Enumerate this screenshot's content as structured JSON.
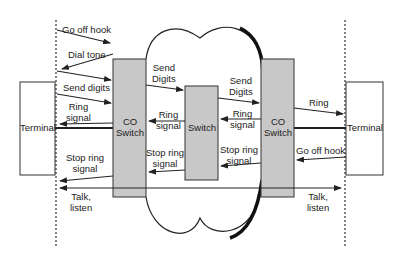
{
  "diagram": {
    "type": "call-setup-sequence",
    "colors": {
      "switch_fill": "#c8c8c8",
      "stroke": "#222222",
      "terminal_fill": "#ffffff",
      "background": "#ffffff"
    },
    "nodes": {
      "left_terminal": "Terminal",
      "left_co_switch": "CO\nSwitch",
      "center_switch": "Switch",
      "right_co_switch": "CO\nSwitch",
      "right_terminal": "Terminal"
    },
    "labels": {
      "go_off_hook_left": "Go off hook",
      "dial_tone": "Dial tone",
      "send_digits_left": "Send digits",
      "ring_signal_left": "Ring\nsignal",
      "stop_ring_signal_left": "Stop ring\nsignal",
      "talk_listen_left": "Talk,\nlisten",
      "send_digits_mid_left": "Send\nDigits",
      "ring_signal_mid_left": "Ring\nsignal",
      "stop_ring_signal_mid_left": "Stop ring\nsignal",
      "send_digits_mid_right": "Send\nDigits",
      "ring_signal_mid_right": "Ring\nsignal",
      "stop_ring_signal_mid_right": "Stop ring\nsignal",
      "ring_right": "Ring",
      "go_off_hook_right": "Go off hook",
      "talk_listen_right": "Talk,\nlisten"
    },
    "messages": [
      {
        "from": "left_terminal",
        "to": "left_co_switch",
        "label": "Go off hook"
      },
      {
        "from": "left_co_switch",
        "to": "left_terminal",
        "label": "Dial tone"
      },
      {
        "from": "left_terminal",
        "to": "left_co_switch",
        "label": "Send digits"
      },
      {
        "from": "left_co_switch",
        "to": "center_switch",
        "label": "Send Digits"
      },
      {
        "from": "center_switch",
        "to": "right_co_switch",
        "label": "Send Digits"
      },
      {
        "from": "right_co_switch",
        "to": "right_terminal",
        "label": "Ring"
      },
      {
        "from": "right_co_switch",
        "to": "center_switch",
        "label": "Ring signal"
      },
      {
        "from": "center_switch",
        "to": "left_co_switch",
        "label": "Ring signal"
      },
      {
        "from": "left_co_switch",
        "to": "left_terminal",
        "label": "Ring signal"
      },
      {
        "from": "right_terminal",
        "to": "right_co_switch",
        "label": "Go off hook"
      },
      {
        "from": "right_co_switch",
        "to": "center_switch",
        "label": "Stop ring signal"
      },
      {
        "from": "center_switch",
        "to": "left_co_switch",
        "label": "Stop ring signal"
      },
      {
        "from": "left_co_switch",
        "to": "left_terminal",
        "label": "Stop ring signal"
      },
      {
        "from": "left_terminal",
        "to": "right_terminal",
        "label": "Talk, listen",
        "bidirectional": true
      }
    ]
  }
}
